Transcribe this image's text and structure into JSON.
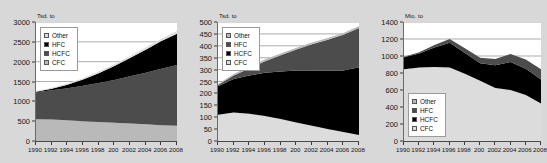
{
  "page": {
    "background_color": "#d8d8d8",
    "panel_background": "#ffffff"
  },
  "palette": {
    "cfc": "#b9b9b9",
    "hcfc_dark_gray": "#4c4c4c",
    "hcfc_black": "#000000",
    "hfc_black": "#000000",
    "hfc_dark_gray": "#4c4c4c",
    "other": "#dcdcdc",
    "gridline": "#8a8a8a",
    "axis": "#3a3a3a",
    "text": "#151515"
  },
  "charts": [
    {
      "id": "chart-left",
      "unit_label": "Tsd. to",
      "ylabel": "Tsd. to",
      "ytick_labels": [
        "3000",
        "2500",
        "2000",
        "1500",
        "1000",
        "500",
        "0"
      ],
      "xtick_labels": [
        "1990",
        "1992",
        "1994",
        "1996",
        "1998",
        "200",
        "2002",
        "2004",
        "2006",
        "2008"
      ],
      "legend_position": "top-left",
      "legend": [
        {
          "label": "Other",
          "color": "#dcdcdc"
        },
        {
          "label": "HFC",
          "color": "#000000"
        },
        {
          "label": "HCFC",
          "color": "#4c4c4c"
        },
        {
          "label": "CFC",
          "color": "#b9b9b9"
        }
      ]
    },
    {
      "id": "chart-middle",
      "unit_label": "Tsd. to",
      "ylabel": "Tsd. to",
      "ytick_labels": [
        "500",
        "450",
        "400",
        "350",
        "300",
        "250",
        "200",
        "150",
        "100",
        "50",
        "0"
      ],
      "xtick_labels": [
        "1990",
        "1992",
        "1994",
        "1996",
        "1998",
        "200",
        "2002",
        "2004",
        "2006",
        "2008"
      ],
      "legend_position": "top-left",
      "legend": [
        {
          "label": "Other",
          "color": "#b9b9b9"
        },
        {
          "label": "HFC",
          "color": "#4c4c4c"
        },
        {
          "label": "HCFC",
          "color": "#000000"
        },
        {
          "label": "CFC",
          "color": "#dcdcdc"
        }
      ]
    },
    {
      "id": "chart-right",
      "unit_label": "Mio. to",
      "ylabel": "Mio. to",
      "ytick_labels": [
        "1400",
        "1200",
        "1000",
        "800",
        "600",
        "400",
        "200",
        "0"
      ],
      "xtick_labels": [
        "1990",
        "1992",
        "1994",
        "1996",
        "1998",
        "200",
        "2002",
        "2004",
        "2006",
        "2008"
      ],
      "legend_position": "bottom-left",
      "legend": [
        {
          "label": "Other",
          "color": "#b9b9b9"
        },
        {
          "label": "HFC",
          "color": "#4c4c4c"
        },
        {
          "label": "HCFC",
          "color": "#000000"
        },
        {
          "label": "CFC",
          "color": "#dcdcdc"
        }
      ]
    }
  ],
  "chart_data": [
    {
      "type": "area",
      "id": "chart-left",
      "title": "",
      "xlabel": "",
      "ylabel": "Tsd. to",
      "ylim": [
        0,
        3000
      ],
      "ytick_values": [
        0,
        500,
        1000,
        1500,
        2000,
        2500,
        3000
      ],
      "grid": true,
      "stacked": true,
      "legend_position": "top-left",
      "x": [
        1990,
        1992,
        1994,
        1996,
        1998,
        2000,
        2002,
        2004,
        2006,
        2008
      ],
      "categories": [
        "1990",
        "1992",
        "1994",
        "1996",
        "1998",
        "200",
        "2002",
        "2004",
        "2006",
        "2008"
      ],
      "series": [
        {
          "name": "CFC",
          "color": "#b9b9b9",
          "values": [
            550,
            540,
            520,
            500,
            480,
            460,
            440,
            420,
            400,
            385
          ]
        },
        {
          "name": "HCFC",
          "color": "#4c4c4c",
          "values": [
            680,
            740,
            810,
            890,
            980,
            1080,
            1190,
            1300,
            1420,
            1530
          ]
        },
        {
          "name": "HFC",
          "color": "#000000",
          "values": [
            10,
            40,
            90,
            160,
            250,
            350,
            460,
            580,
            700,
            790
          ]
        },
        {
          "name": "Other",
          "color": "#dcdcdc",
          "values": [
            20,
            25,
            30,
            35,
            40,
            45,
            50,
            55,
            60,
            65
          ]
        }
      ],
      "totals": [
        1260,
        1345,
        1450,
        1585,
        1750,
        1935,
        2140,
        2355,
        2580,
        2770
      ]
    },
    {
      "type": "area",
      "id": "chart-middle",
      "title": "",
      "xlabel": "",
      "ylabel": "Tsd. to",
      "ylim": [
        0,
        500
      ],
      "ytick_values": [
        0,
        50,
        100,
        150,
        200,
        250,
        300,
        350,
        400,
        450,
        500
      ],
      "grid": true,
      "stacked": true,
      "legend_position": "top-left",
      "x": [
        1990,
        1992,
        1994,
        1996,
        1998,
        2000,
        2002,
        2004,
        2006,
        2008
      ],
      "categories": [
        "1990",
        "1992",
        "1994",
        "1996",
        "1998",
        "200",
        "2002",
        "2004",
        "2006",
        "2008"
      ],
      "series": [
        {
          "name": "CFC",
          "color": "#dcdcdc",
          "values": [
            110,
            120,
            115,
            105,
            92,
            78,
            64,
            50,
            38,
            25
          ]
        },
        {
          "name": "HCFC",
          "color": "#000000",
          "values": [
            120,
            140,
            160,
            182,
            200,
            218,
            232,
            245,
            258,
            285
          ]
        },
        {
          "name": "HFC",
          "color": "#4c4c4c",
          "values": [
            5,
            15,
            30,
            48,
            68,
            88,
            110,
            130,
            150,
            165
          ]
        },
        {
          "name": "Other",
          "color": "#b9b9b9",
          "values": [
            5,
            6,
            7,
            8,
            8,
            8,
            8,
            8,
            8,
            8
          ]
        }
      ],
      "totals": [
        240,
        281,
        312,
        343,
        368,
        392,
        414,
        433,
        454,
        483
      ]
    },
    {
      "type": "area",
      "id": "chart-right",
      "title": "",
      "xlabel": "",
      "ylabel": "Mio. to",
      "ylim": [
        0,
        1400
      ],
      "ytick_values": [
        0,
        200,
        400,
        600,
        800,
        1000,
        1200,
        1400
      ],
      "grid": true,
      "stacked": true,
      "legend_position": "bottom-left",
      "x": [
        1990,
        1992,
        1994,
        1996,
        1998,
        2000,
        2002,
        2004,
        2006,
        2008
      ],
      "categories": [
        "1990",
        "1992",
        "1994",
        "1996",
        "1998",
        "200",
        "2002",
        "2004",
        "2006",
        "2008"
      ],
      "series": [
        {
          "name": "CFC",
          "color": "#dcdcdc",
          "values": [
            845,
            865,
            870,
            865,
            790,
            710,
            625,
            600,
            540,
            440
          ]
        },
        {
          "name": "HCFC",
          "color": "#000000",
          "values": [
            140,
            165,
            230,
            290,
            245,
            205,
            265,
            330,
            310,
            285
          ]
        },
        {
          "name": "HFC",
          "color": "#4c4c4c",
          "values": [
            5,
            15,
            30,
            45,
            55,
            65,
            75,
            95,
            110,
            120
          ]
        },
        {
          "name": "Other",
          "color": "#b9b9b9",
          "values": [
            0,
            0,
            0,
            0,
            0,
            0,
            0,
            0,
            0,
            0
          ]
        }
      ],
      "totals": [
        990,
        1045,
        1130,
        1160,
        1090,
        980,
        965,
        1025,
        960,
        845
      ]
    }
  ]
}
